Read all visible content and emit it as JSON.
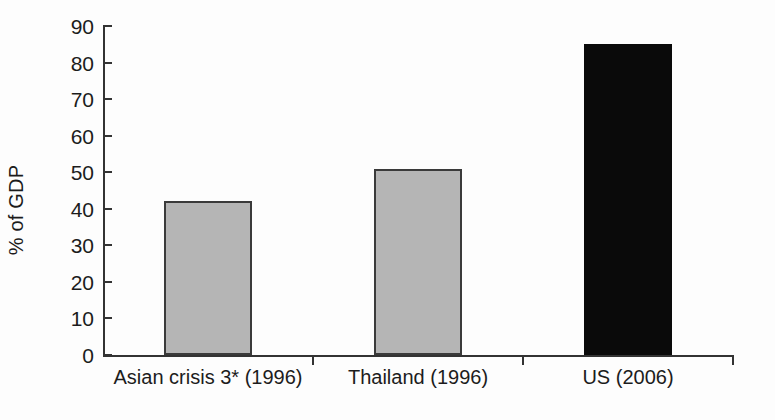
{
  "chart_data": {
    "type": "bar",
    "title": "",
    "subtitle": "",
    "xlabel": "",
    "ylabel": "% of GDP",
    "ylim": [
      0,
      90
    ],
    "yticks": [
      0,
      10,
      20,
      30,
      40,
      50,
      60,
      70,
      80,
      90
    ],
    "ytick_labels": [
      "0",
      "10",
      "20",
      "30",
      "40",
      "50",
      "60",
      "70",
      "80",
      "90"
    ],
    "grid": false,
    "legend": null,
    "categories": [
      "Asian crisis 3* (1996)",
      "Thailand (1996)",
      "US (2006)"
    ],
    "values": [
      42,
      51,
      85
    ],
    "bar_colors": [
      "#b5b5b5",
      "#b5b5b5",
      "#0a0a0a"
    ],
    "bar_edge_colors": [
      "#3a3a3a",
      "#3a3a3a",
      "#0a0a0a"
    ],
    "annotations": []
  },
  "colors": {
    "background": "#fdfdfd",
    "axis": "#333333",
    "text": "#1c1c1c",
    "bar_gray": "#b5b5b5",
    "bar_black": "#0a0a0a"
  }
}
